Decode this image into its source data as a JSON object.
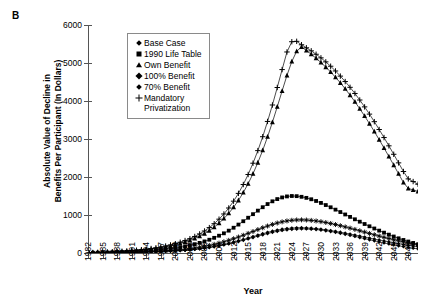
{
  "panel": {
    "label": "B"
  },
  "axes": {
    "ylabel_line1": "Absolute Value of Decline in",
    "ylabel_line2": "Benefits Per Participant (In Dollars)",
    "xlabel": "Year",
    "yticks": [
      0,
      1000,
      2000,
      3000,
      4000,
      5000,
      6000
    ],
    "xticks": [
      1982,
      1985,
      1988,
      1991,
      1994,
      1997,
      2000,
      2003,
      2006,
      2009,
      2012,
      2015,
      2018,
      2021,
      2024,
      2027,
      2030,
      2033,
      2036,
      2039,
      2042,
      2045,
      2048
    ]
  },
  "legend": {
    "items": [
      {
        "label": "Base Case",
        "label2": "",
        "marker": "diamond"
      },
      {
        "label": "1990 Life Table",
        "label2": "",
        "marker": "square"
      },
      {
        "label": "Own Benefit",
        "label2": "",
        "marker": "triangle"
      },
      {
        "label": "100% Benefit",
        "label2": "",
        "marker": "star"
      },
      {
        "label": "70% Benefit",
        "label2": "",
        "marker": "diamond"
      },
      {
        "label": "Mandatory",
        "label2": "Privatization",
        "marker": "plus"
      }
    ]
  },
  "chart_data": {
    "type": "line",
    "title": "",
    "xlabel": "Year",
    "ylabel": "Absolute Value of Decline in Benefits Per Participant (In Dollars)",
    "xlim": [
      1982,
      2050
    ],
    "ylim": [
      0,
      6000
    ],
    "grid": false,
    "legend_position": "upper-left-inside",
    "x": [
      1982,
      1983,
      1984,
      1985,
      1986,
      1987,
      1988,
      1989,
      1990,
      1991,
      1992,
      1993,
      1994,
      1995,
      1996,
      1997,
      1998,
      1999,
      2000,
      2001,
      2002,
      2003,
      2004,
      2005,
      2006,
      2007,
      2008,
      2009,
      2010,
      2011,
      2012,
      2013,
      2014,
      2015,
      2016,
      2017,
      2018,
      2019,
      2020,
      2021,
      2022,
      2023,
      2024,
      2025,
      2026,
      2027,
      2028,
      2029,
      2030,
      2031,
      2032,
      2033,
      2034,
      2035,
      2036,
      2037,
      2038,
      2039,
      2040,
      2041,
      2042,
      2043,
      2044,
      2045,
      2046,
      2047,
      2048,
      2049,
      2050
    ],
    "series": [
      {
        "name": "Base Case",
        "marker": "diamond",
        "values": [
          2,
          3,
          4,
          5,
          6,
          8,
          9,
          11,
          13,
          15,
          18,
          21,
          24,
          28,
          32,
          37,
          42,
          48,
          55,
          63,
          72,
          82,
          94,
          108,
          124,
          142,
          163,
          186,
          212,
          240,
          270,
          302,
          336,
          371,
          407,
          443,
          478,
          512,
          543,
          570,
          593,
          611,
          624,
          632,
          635,
          633,
          627,
          617,
          603,
          586,
          566,
          543,
          518,
          492,
          464,
          436,
          407,
          378,
          349,
          320,
          292,
          265,
          239,
          214,
          190,
          168,
          147,
          128,
          110
        ]
      },
      {
        "name": "1990 Life Table",
        "marker": "square",
        "values": [
          5,
          7,
          9,
          12,
          15,
          18,
          22,
          26,
          31,
          36,
          42,
          49,
          57,
          66,
          76,
          88,
          101,
          116,
          133,
          153,
          176,
          202,
          232,
          266,
          305,
          349,
          399,
          455,
          518,
          588,
          665,
          748,
          836,
          928,
          1022,
          1115,
          1205,
          1288,
          1360,
          1419,
          1462,
          1489,
          1500,
          1496,
          1479,
          1451,
          1414,
          1369,
          1318,
          1262,
          1203,
          1141,
          1078,
          1014,
          950,
          887,
          824,
          763,
          703,
          645,
          589,
          535,
          483,
          434,
          387,
          343,
          302,
          264,
          229
        ]
      },
      {
        "name": "Own Benefit",
        "marker": "triangle",
        "values": [
          8,
          11,
          14,
          18,
          22,
          27,
          33,
          39,
          47,
          55,
          65,
          76,
          89,
          104,
          121,
          140,
          162,
          187,
          216,
          249,
          288,
          332,
          383,
          442,
          510,
          589,
          680,
          785,
          906,
          1045,
          1204,
          1385,
          1591,
          1824,
          2086,
          2379,
          2703,
          3058,
          3441,
          3847,
          4265,
          4674,
          5040,
          5310,
          5420,
          5330,
          5230,
          5125,
          5012,
          4892,
          4763,
          4625,
          4478,
          4321,
          4155,
          3980,
          3796,
          3604,
          3404,
          3197,
          2983,
          2764,
          2540,
          2313,
          2084,
          1855,
          1700,
          1660,
          1620
        ]
      },
      {
        "name": "100% Benefit",
        "marker": "star",
        "values": [
          3,
          4,
          5,
          6,
          8,
          10,
          12,
          14,
          17,
          20,
          24,
          28,
          33,
          38,
          44,
          51,
          59,
          68,
          78,
          89,
          102,
          117,
          134,
          153,
          175,
          200,
          228,
          259,
          294,
          333,
          375,
          420,
          467,
          516,
          566,
          616,
          664,
          710,
          752,
          789,
          820,
          844,
          861,
          870,
          872,
          868,
          858,
          844,
          825,
          803,
          777,
          749,
          719,
          687,
          654,
          620,
          585,
          550,
          515,
          480,
          446,
          412,
          380,
          349,
          319,
          291,
          264,
          239,
          215
        ]
      },
      {
        "name": "70% Benefit",
        "marker": "diamond",
        "values": [
          2,
          3,
          4,
          5,
          6,
          7,
          9,
          11,
          13,
          15,
          18,
          21,
          25,
          29,
          34,
          39,
          45,
          52,
          60,
          69,
          79,
          90,
          103,
          118,
          135,
          154,
          175,
          199,
          226,
          256,
          288,
          322,
          358,
          395,
          433,
          471,
          508,
          543,
          575,
          603,
          626,
          644,
          656,
          663,
          664,
          661,
          653,
          642,
          628,
          611,
          591,
          570,
          547,
          523,
          498,
          472,
          445,
          419,
          392,
          366,
          340,
          314,
          290,
          266,
          243,
          222,
          201,
          182,
          164
        ]
      },
      {
        "name": "Mandatory Privatization",
        "marker": "plus",
        "values": [
          9,
          12,
          16,
          20,
          25,
          31,
          37,
          45,
          53,
          63,
          74,
          87,
          101,
          118,
          137,
          159,
          184,
          212,
          245,
          283,
          327,
          377,
          435,
          502,
          579,
          668,
          771,
          890,
          1027,
          1184,
          1364,
          1569,
          1802,
          2066,
          2363,
          2694,
          3060,
          3462,
          3895,
          4355,
          4827,
          5290,
          5560,
          5570,
          5480,
          5400,
          5320,
          5230,
          5135,
          5030,
          4915,
          4790,
          4655,
          4512,
          4360,
          4198,
          4026,
          3845,
          3655,
          3456,
          3250,
          3038,
          2820,
          2598,
          2372,
          2145,
          1950,
          1880,
          1810
        ]
      }
    ]
  }
}
